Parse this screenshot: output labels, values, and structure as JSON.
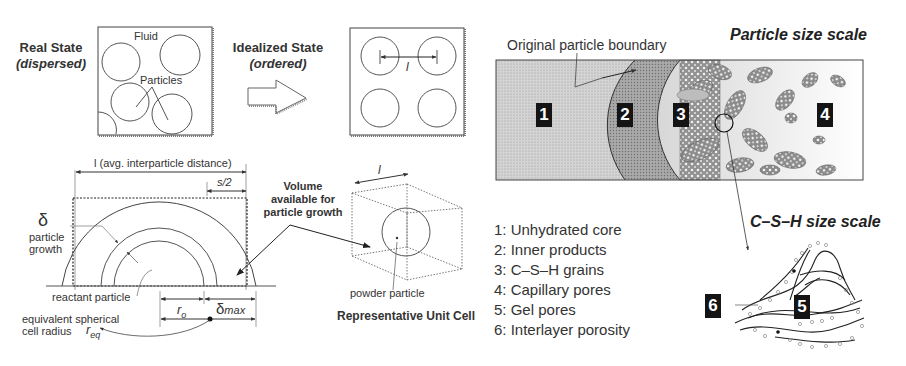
{
  "real_state": {
    "title": "Real State",
    "subtitle": "(dispersed)",
    "fluid_label": "Fluid",
    "particles_label": "Particles"
  },
  "idealized_state": {
    "title": "Idealized State",
    "subtitle": "(ordered)",
    "spacing_label": "l"
  },
  "growth_diagram": {
    "distance_label": "l  (avg. interparticle distance)",
    "s_half_label": "s/2",
    "delta_symbol": "δ",
    "growth_label_1": "particle",
    "growth_label_2": "growth",
    "reactant_label": "reactant particle",
    "r0_label": "r",
    "r0_sub": "o",
    "delta_max_label": "δ",
    "delta_max_sub": "max",
    "equiv_label_1": "equivalent spherical",
    "equiv_label_2": "cell radius",
    "req_label": "r",
    "req_sub": "eq"
  },
  "volume_callout": {
    "line1": "Volume",
    "line2": "available for",
    "line3": "particle growth"
  },
  "unit_cell": {
    "edge_label": "l",
    "particle_label": "powder particle",
    "title": "Representative Unit Cell"
  },
  "particle_scale": {
    "title": "Particle size scale",
    "boundary_label": "Original particle boundary",
    "zones": [
      "1",
      "2",
      "3",
      "4"
    ]
  },
  "csh_scale": {
    "title": "C–S–H size scale",
    "zones": [
      "5",
      "6"
    ]
  },
  "legend": [
    {
      "num": "1:",
      "label": "Unhydrated core"
    },
    {
      "num": "2:",
      "label": "Inner products"
    },
    {
      "num": "3:",
      "label": "C–S–H grains"
    },
    {
      "num": "4:",
      "label": "Capillary pores"
    },
    {
      "num": "5:",
      "label": "Gel pores"
    },
    {
      "num": "6:",
      "label": "Interlayer porosity"
    }
  ]
}
